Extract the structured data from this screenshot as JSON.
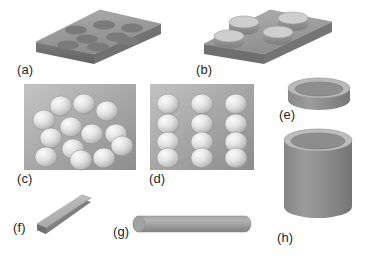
{
  "figure": {
    "background_color": "#ffffff",
    "label_color": "#231f20",
    "palette": {
      "plate_top": "#9b9b9b",
      "plate_top_light": "#b3b3b3",
      "plate_side": "#6e6e6e",
      "plate_edge": "#858585",
      "hole_fill": "#7b7b7b",
      "disc_top": "#c2c2c2",
      "disc_side": "#8f8f8f",
      "sphere_light": "#f2f2f2",
      "sphere_mid": "#d8d8d8",
      "sphere_dark": "#9d9d9d",
      "substrate_light": "#bdbdbd",
      "substrate_dark": "#8e8e8e",
      "tube_body": "#8b8b8b",
      "tube_rim_outer": "#b8b8b8",
      "tube_rim_inner": "#8a8a8a",
      "rod_body": "#9a9a9a",
      "rod_highlight": "#b5b5b5",
      "strip_top": "#c0c0c0",
      "strip_side": "#8a8a8a"
    },
    "panels": [
      {
        "id": "a",
        "label": "(a)",
        "caption_text": "(a)",
        "shape": "perforated-plate",
        "description": "Flat square plate in perspective with eight dark circular holes arranged 3-2-3",
        "hole_count": 8,
        "hole_rows": [
          3,
          2,
          3
        ]
      },
      {
        "id": "b",
        "label": "(b)",
        "caption_text": "(b)",
        "shape": "plate-with-discs",
        "description": "Flat square plate in perspective supporting four short cylindrical discs",
        "disc_count": 4,
        "disc_rows": [
          2,
          2
        ]
      },
      {
        "id": "c",
        "label": "(c)",
        "caption_text": "(c)",
        "shape": "substrate-with-random-spheres",
        "description": "Gray square substrate with thirteen hemispherical particles in a random arrangement",
        "sphere_count": 13,
        "arrangement": "random"
      },
      {
        "id": "d",
        "label": "(d)",
        "caption_text": "(d)",
        "shape": "substrate-with-ordered-spheres",
        "description": "Gray square substrate with twelve hemispherical particles in a regular 3 by 4 array",
        "sphere_count": 12,
        "arrangement": "ordered 3 x 4",
        "columns": 3,
        "rows": 4
      },
      {
        "id": "e",
        "label": "(e)",
        "caption_text": "(e)",
        "shape": "short-hollow-cylinder",
        "description": "Short hollow ring or washer shown in perspective"
      },
      {
        "id": "f",
        "label": "(f)",
        "caption_text": "(f)",
        "shape": "flat-strip",
        "description": "Thin flat rectangular strip inclined diagonally"
      },
      {
        "id": "g",
        "label": "(g)",
        "caption_text": "(g)",
        "shape": "solid-rod",
        "description": "Long horizontal solid cylindrical rod"
      },
      {
        "id": "h",
        "label": "(h)",
        "caption_text": "(h)",
        "shape": "tall-hollow-cylinder",
        "description": "Tall hollow cylindrical tube shown in perspective"
      }
    ]
  }
}
